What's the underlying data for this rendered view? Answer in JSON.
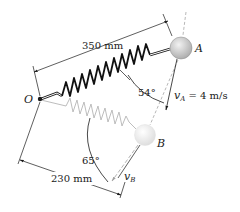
{
  "diagram": {
    "labels": {
      "pivot": "O",
      "mass_a": "A",
      "mass_b": "B",
      "length_a": "350 mm",
      "length_b": "230 mm",
      "angle_a": "54°",
      "angle_b": "65°",
      "velocity_a_symbol": "v",
      "velocity_a_sub": "A",
      "velocity_a_value": " = 4 m/s",
      "velocity_b_symbol": "v",
      "velocity_b_sub": "B"
    },
    "colors": {
      "ink": "#1a1a1a",
      "spring_a": "#111111",
      "spring_b": "#bdbdbd",
      "ball_a": "#c9c9c9",
      "ball_b": "#ececec",
      "dashed": "#9a9a9a"
    }
  }
}
